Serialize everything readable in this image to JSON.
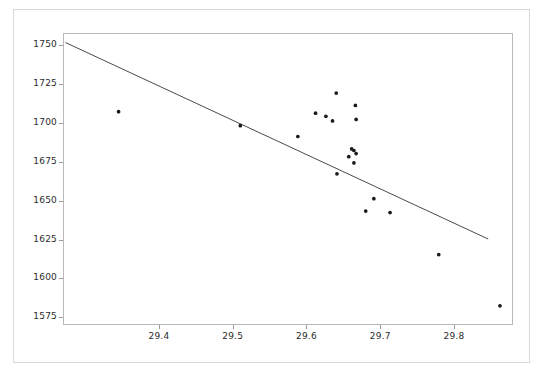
{
  "chart_data": {
    "type": "scatter",
    "title": "",
    "subtitle": "",
    "xlabel": "",
    "ylabel": "",
    "grid": false,
    "legend": null,
    "xlim": [
      29.27,
      29.88
    ],
    "ylim": [
      1570,
      1758
    ],
    "xticks": [
      29.4,
      29.5,
      29.6,
      29.7,
      29.8
    ],
    "xtick_labels": [
      "29.4",
      "29.5",
      "29.6",
      "29.7",
      "29.8"
    ],
    "yticks": [
      1575,
      1600,
      1625,
      1650,
      1675,
      1700,
      1725,
      1750
    ],
    "ytick_labels": [
      "1575",
      "1600",
      "1625",
      "1650",
      "1675",
      "1700",
      "1725",
      "1750"
    ],
    "marker": {
      "shape": "circle",
      "size": 3,
      "color": "#1a1a1a"
    },
    "points": [
      {
        "x": 29.344,
        "y": 1708
      },
      {
        "x": 29.509,
        "y": 1699
      },
      {
        "x": 29.587,
        "y": 1692
      },
      {
        "x": 29.639,
        "y": 1720
      },
      {
        "x": 29.611,
        "y": 1707
      },
      {
        "x": 29.625,
        "y": 1705
      },
      {
        "x": 29.634,
        "y": 1702
      },
      {
        "x": 29.665,
        "y": 1712
      },
      {
        "x": 29.666,
        "y": 1703
      },
      {
        "x": 29.66,
        "y": 1684
      },
      {
        "x": 29.663,
        "y": 1683
      },
      {
        "x": 29.656,
        "y": 1679
      },
      {
        "x": 29.666,
        "y": 1681
      },
      {
        "x": 29.663,
        "y": 1675
      },
      {
        "x": 29.64,
        "y": 1668
      },
      {
        "x": 29.69,
        "y": 1652
      },
      {
        "x": 29.679,
        "y": 1644
      },
      {
        "x": 29.712,
        "y": 1643
      },
      {
        "x": 29.778,
        "y": 1616
      },
      {
        "x": 29.861,
        "y": 1583
      }
    ],
    "trendline": {
      "type": "line",
      "color": "#4a4a4a",
      "x_start": 29.272,
      "y_start": 1752.5,
      "x_end": 29.845,
      "y_end": 1626.0,
      "slope": -220.8,
      "intercept": 8315.0
    }
  }
}
